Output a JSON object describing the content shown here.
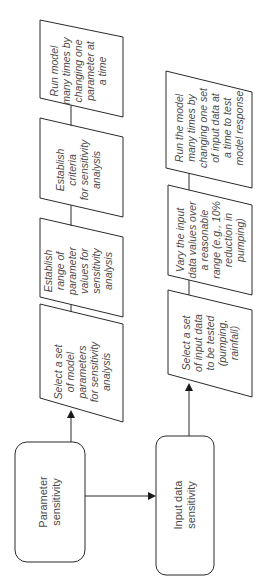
{
  "diagram": {
    "orientation": "rotated -90deg (reads bottom-to-top)",
    "colors": {
      "stroke": "#2a2a2a",
      "text": "#4a4a4a",
      "background": "#ffffff"
    },
    "start_nodes": {
      "parameter_sensitivity": {
        "line1": "Parameter",
        "line2": "sensitivity"
      },
      "input_data_sensitivity": {
        "line1": "Input data",
        "line2": "sensitivity"
      }
    },
    "parameter_steps": [
      {
        "lines": [
          "Select a set",
          "of model",
          "parameters",
          "for sensitivity",
          "analysis"
        ]
      },
      {
        "lines": [
          "Establish",
          "range of",
          "parameter",
          "values for",
          "sensitivity",
          "analysis"
        ]
      },
      {
        "lines": [
          "Establish",
          "criteria",
          "for sensitivity",
          "analysis"
        ]
      },
      {
        "lines": [
          "Run model",
          "many times by",
          "changing one",
          "parameter at",
          "a time"
        ]
      }
    ],
    "input_steps": [
      {
        "lines": [
          "Select a set",
          "of input data",
          "to be tested",
          "(pumping,",
          "rainfall)"
        ]
      },
      {
        "lines": [
          "Vary the input",
          "data values over",
          "a reasonable",
          "range (e.g., 10%",
          "reduction in",
          "pumping)"
        ]
      },
      {
        "lines": [
          "Run the model",
          "many times by",
          "changing one set",
          "of input data at",
          "a time to test",
          "model response"
        ]
      }
    ]
  }
}
